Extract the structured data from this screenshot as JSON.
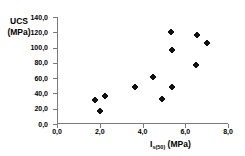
{
  "chart_data": {
    "type": "scatter",
    "title": "",
    "xlabel": "I s(50) (MPa)",
    "xlabel_base": "I",
    "xlabel_sub": "s(50)",
    "xlabel_unit": "(MPa)",
    "ylabel": "UCS (MPa)",
    "ylabel_line1": "UCS",
    "ylabel_line2": "(MPa)",
    "xlim": [
      0.0,
      8.0
    ],
    "ylim": [
      0.0,
      140.0
    ],
    "xticks": [
      "0,0",
      "2,0",
      "4,0",
      "6,0",
      "8,0"
    ],
    "xtick_values": [
      0.0,
      2.0,
      4.0,
      6.0,
      8.0
    ],
    "yticks": [
      "0,0",
      "20,0",
      "40,0",
      "60,0",
      "80,0",
      "100,0",
      "120,0",
      "140,0"
    ],
    "ytick_values": [
      0.0,
      20.0,
      40.0,
      60.0,
      80.0,
      100.0,
      120.0,
      140.0
    ],
    "grid": false,
    "legend": false,
    "marker_color": "#111111",
    "axis_color": "#7a7a7a",
    "points": [
      {
        "x": 1.8,
        "y": 31.5
      },
      {
        "x": 2.0,
        "y": 17.0
      },
      {
        "x": 2.25,
        "y": 36.5
      },
      {
        "x": 3.65,
        "y": 49.0
      },
      {
        "x": 4.5,
        "y": 61.5
      },
      {
        "x": 4.9,
        "y": 33.0
      },
      {
        "x": 5.35,
        "y": 120.5
      },
      {
        "x": 5.4,
        "y": 96.5
      },
      {
        "x": 5.4,
        "y": 48.5
      },
      {
        "x": 6.5,
        "y": 77.5
      },
      {
        "x": 6.55,
        "y": 117.0
      },
      {
        "x": 7.0,
        "y": 106.0
      }
    ]
  }
}
